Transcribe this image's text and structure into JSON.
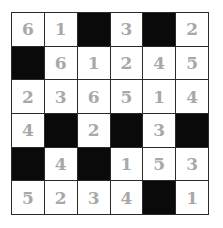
{
  "puzzle": {
    "rows": 6,
    "cols": 6,
    "cells": [
      [
        "6",
        "1",
        "",
        "3",
        "",
        "2"
      ],
      [
        "",
        "6",
        "1",
        "2",
        "4",
        "5"
      ],
      [
        "2",
        "3",
        "6",
        "5",
        "1",
        "4"
      ],
      [
        "4",
        "",
        "2",
        "",
        "3",
        ""
      ],
      [
        "",
        "4",
        "",
        "1",
        "5",
        "3"
      ],
      [
        "5",
        "2",
        "3",
        "4",
        "",
        "1"
      ]
    ],
    "shaded": [
      [
        false,
        false,
        true,
        false,
        true,
        false
      ],
      [
        true,
        false,
        false,
        false,
        false,
        false
      ],
      [
        false,
        false,
        false,
        false,
        false,
        false
      ],
      [
        false,
        true,
        false,
        true,
        false,
        true
      ],
      [
        true,
        false,
        true,
        false,
        false,
        false
      ],
      [
        false,
        false,
        false,
        false,
        true,
        false
      ]
    ],
    "colors": {
      "digit": "#a8a8a8",
      "shaded": "#0a0a0a",
      "grid": "#2a2a2a",
      "cell": "#ffffff"
    }
  }
}
